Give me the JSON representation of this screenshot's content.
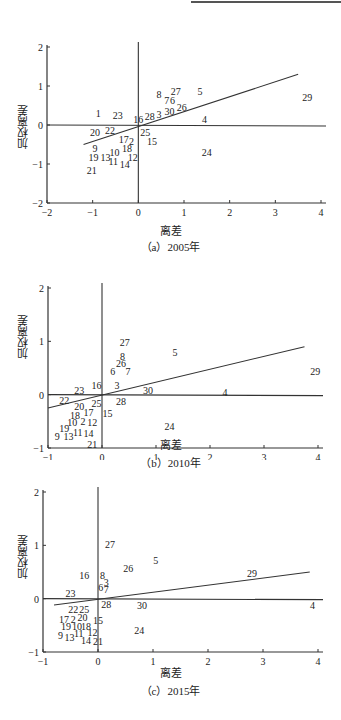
{
  "chart_data": [
    {
      "type": "scatter",
      "title": "(a) 2005年",
      "xlabel": "离差",
      "ylabel": "加权离差",
      "xlim": [
        -2,
        4
      ],
      "ylim": [
        -2,
        2
      ],
      "xticks": [
        "-2",
        "-1",
        "0",
        "1",
        "2",
        "3",
        "4"
      ],
      "yticks": [
        "-2",
        "-1",
        "0",
        "1",
        "2"
      ],
      "grid": false,
      "trendline": {
        "x": [
          -1.2,
          3.5
        ],
        "y": [
          -0.5,
          1.3
        ]
      },
      "points": [
        {
          "label": "1",
          "x": -0.88,
          "y": 0.3
        },
        {
          "label": "2",
          "x": -0.15,
          "y": -0.4
        },
        {
          "label": "3",
          "x": 0.45,
          "y": 0.28
        },
        {
          "label": "4",
          "x": 1.45,
          "y": 0.15
        },
        {
          "label": "5",
          "x": 1.35,
          "y": 0.88
        },
        {
          "label": "6",
          "x": 0.75,
          "y": 0.65
        },
        {
          "label": "7",
          "x": 0.62,
          "y": 0.65
        },
        {
          "label": "8",
          "x": 0.45,
          "y": 0.8
        },
        {
          "label": "9",
          "x": -0.95,
          "y": -0.58
        },
        {
          "label": "10",
          "x": -0.52,
          "y": -0.68
        },
        {
          "label": "11",
          "x": -0.55,
          "y": -0.92
        },
        {
          "label": "12",
          "x": -0.12,
          "y": -0.82
        },
        {
          "label": "13",
          "x": -0.72,
          "y": -0.82
        },
        {
          "label": "14",
          "x": -0.3,
          "y": -1.0
        },
        {
          "label": "15",
          "x": 0.3,
          "y": -0.4
        },
        {
          "label": "16",
          "x": 0.0,
          "y": 0.15
        },
        {
          "label": "17",
          "x": -0.32,
          "y": -0.35
        },
        {
          "label": "18",
          "x": -0.25,
          "y": -0.6
        },
        {
          "label": "19",
          "x": -0.98,
          "y": -0.82
        },
        {
          "label": "20",
          "x": -0.95,
          "y": -0.18
        },
        {
          "label": "21",
          "x": -1.02,
          "y": -1.15
        },
        {
          "label": "22",
          "x": -0.62,
          "y": -0.12
        },
        {
          "label": "23",
          "x": -0.45,
          "y": 0.25
        },
        {
          "label": "24",
          "x": 1.5,
          "y": -0.68
        },
        {
          "label": "25",
          "x": 0.15,
          "y": -0.18
        },
        {
          "label": "26",
          "x": 0.95,
          "y": 0.45
        },
        {
          "label": "27",
          "x": 0.82,
          "y": 0.88
        },
        {
          "label": "28",
          "x": 0.25,
          "y": 0.22
        },
        {
          "label": "29",
          "x": 3.7,
          "y": 0.72
        },
        {
          "label": "30",
          "x": 0.68,
          "y": 0.35
        }
      ]
    },
    {
      "type": "scatter",
      "title": "(b) 2010年",
      "xlabel": "离差",
      "ylabel": "加权离差",
      "xlim": [
        -1,
        4
      ],
      "ylim": [
        -1,
        2
      ],
      "xticks": [
        "-1",
        "0",
        "1",
        "2",
        "3",
        "4"
      ],
      "yticks": [
        "-1",
        "0",
        "1",
        "2"
      ],
      "grid": false,
      "trendline": {
        "x": [
          -1.0,
          3.75
        ],
        "y": [
          -0.25,
          0.9
        ]
      },
      "points": [
        {
          "label": "2",
          "x": -0.35,
          "y": -0.5
        },
        {
          "label": "3",
          "x": 0.28,
          "y": 0.18
        },
        {
          "label": "4",
          "x": 2.28,
          "y": 0.05
        },
        {
          "label": "5",
          "x": 1.35,
          "y": 0.8
        },
        {
          "label": "6",
          "x": 0.2,
          "y": 0.45
        },
        {
          "label": "7",
          "x": 0.48,
          "y": 0.45
        },
        {
          "label": "8",
          "x": 0.38,
          "y": 0.72
        },
        {
          "label": "9",
          "x": -0.83,
          "y": -0.78
        },
        {
          "label": "10",
          "x": -0.55,
          "y": -0.52
        },
        {
          "label": "11",
          "x": -0.45,
          "y": -0.7
        },
        {
          "label": "12",
          "x": -0.18,
          "y": -0.52
        },
        {
          "label": "13",
          "x": -0.62,
          "y": -0.78
        },
        {
          "label": "14",
          "x": -0.25,
          "y": -0.72
        },
        {
          "label": "15",
          "x": 0.1,
          "y": -0.35
        },
        {
          "label": "16",
          "x": -0.1,
          "y": 0.18
        },
        {
          "label": "17",
          "x": -0.25,
          "y": -0.33
        },
        {
          "label": "18",
          "x": -0.5,
          "y": -0.38
        },
        {
          "label": "19",
          "x": -0.7,
          "y": -0.62
        },
        {
          "label": "20",
          "x": -0.42,
          "y": -0.22
        },
        {
          "label": "21",
          "x": -0.18,
          "y": -0.92
        },
        {
          "label": "22",
          "x": -0.7,
          "y": -0.1
        },
        {
          "label": "23",
          "x": -0.42,
          "y": 0.08
        },
        {
          "label": "24",
          "x": 1.25,
          "y": -0.58
        },
        {
          "label": "25",
          "x": -0.1,
          "y": -0.15
        },
        {
          "label": "26",
          "x": 0.35,
          "y": 0.6
        },
        {
          "label": "27",
          "x": 0.42,
          "y": 0.98
        },
        {
          "label": "28",
          "x": 0.35,
          "y": -0.12
        },
        {
          "label": "29",
          "x": 3.95,
          "y": 0.45
        },
        {
          "label": "30",
          "x": 0.85,
          "y": 0.08
        }
      ]
    },
    {
      "type": "scatter",
      "title": "(c) 2015年",
      "xlabel": "离差",
      "ylabel": "加权离差",
      "xlim": [
        -1,
        4
      ],
      "ylim": [
        -1,
        2
      ],
      "xticks": [
        "-1",
        "0",
        "1",
        "2",
        "3",
        "4"
      ],
      "yticks": [
        "-1",
        "0",
        "1",
        "2"
      ],
      "grid": false,
      "trendline": {
        "x": [
          -0.8,
          3.85
        ],
        "y": [
          -0.12,
          0.5
        ]
      },
      "points": [
        {
          "label": "2",
          "x": -0.45,
          "y": -0.38
        },
        {
          "label": "3",
          "x": 0.15,
          "y": 0.32
        },
        {
          "label": "4",
          "x": 3.9,
          "y": -0.12
        },
        {
          "label": "5",
          "x": 1.05,
          "y": 0.72
        },
        {
          "label": "6",
          "x": 0.05,
          "y": 0.22
        },
        {
          "label": "7",
          "x": 0.15,
          "y": 0.18
        },
        {
          "label": "8",
          "x": 0.08,
          "y": 0.45
        },
        {
          "label": "9",
          "x": -0.68,
          "y": -0.68
        },
        {
          "label": "10",
          "x": -0.38,
          "y": -0.52
        },
        {
          "label": "11",
          "x": -0.35,
          "y": -0.65
        },
        {
          "label": "12",
          "x": -0.1,
          "y": -0.62
        },
        {
          "label": "13",
          "x": -0.52,
          "y": -0.72
        },
        {
          "label": "14",
          "x": -0.22,
          "y": -0.78
        },
        {
          "label": "15",
          "x": 0.0,
          "y": -0.4
        },
        {
          "label": "16",
          "x": -0.25,
          "y": 0.45
        },
        {
          "label": "17",
          "x": -0.62,
          "y": -0.38
        },
        {
          "label": "18",
          "x": -0.22,
          "y": -0.52
        },
        {
          "label": "19",
          "x": -0.58,
          "y": -0.52
        },
        {
          "label": "20",
          "x": -0.28,
          "y": -0.35
        },
        {
          "label": "21",
          "x": 0.0,
          "y": -0.8
        },
        {
          "label": "22",
          "x": -0.45,
          "y": -0.2
        },
        {
          "label": "23",
          "x": -0.5,
          "y": 0.1
        },
        {
          "label": "24",
          "x": 0.75,
          "y": -0.58
        },
        {
          "label": "25",
          "x": -0.25,
          "y": -0.2
        },
        {
          "label": "26",
          "x": 0.55,
          "y": 0.58
        },
        {
          "label": "27",
          "x": 0.22,
          "y": 1.02
        },
        {
          "label": "28",
          "x": 0.15,
          "y": -0.1
        },
        {
          "label": "29",
          "x": 2.8,
          "y": 0.48
        },
        {
          "label": "30",
          "x": 0.8,
          "y": -0.12
        }
      ]
    }
  ],
  "captions": {
    "a": "（a）2005年",
    "b": "（b）2010年",
    "c": "（c）2015年"
  },
  "axis": {
    "xlabel": "离差",
    "ylabel": "加权离差"
  }
}
